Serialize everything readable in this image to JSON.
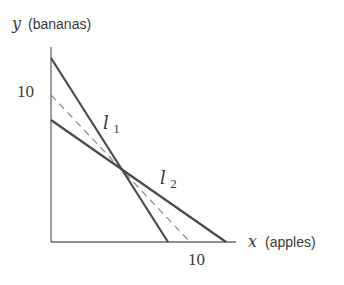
{
  "diagram": {
    "y_axis": {
      "var": "y",
      "label": "(bananas)",
      "tick_label": "10"
    },
    "x_axis": {
      "var": "x",
      "label": "(apples)",
      "tick_label": "10"
    },
    "lines": [
      {
        "name": "l",
        "subscript": "1",
        "style": "solid",
        "color": "#4a4a4a"
      },
      {
        "name": "l",
        "subscript": "2",
        "style": "solid",
        "color": "#4a4a4a"
      },
      {
        "name": "",
        "subscript": "",
        "style": "dashed",
        "color": "#8a8a8a"
      }
    ],
    "axis_color": "#6a6a6a",
    "text_color": "#3a3a3a"
  }
}
